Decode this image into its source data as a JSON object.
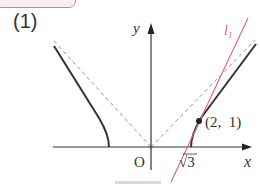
{
  "problem": {
    "part_label": "(1)"
  },
  "axes": {
    "x_label": "x",
    "y_label": "y",
    "origin_label": "O"
  },
  "curve": {
    "description": "hyperbola right and left branches",
    "x_intercept_label": "√3",
    "color": "#333333"
  },
  "asymptotes": {
    "style": "dashed",
    "color": "#999999"
  },
  "tangent_line": {
    "label": "l",
    "subscript": "1",
    "color": "#e0607a"
  },
  "point": {
    "label": "(2, 1)"
  }
}
